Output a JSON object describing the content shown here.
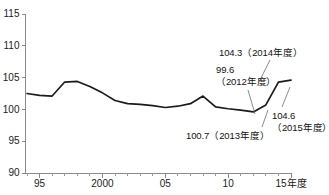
{
  "chart_data": {
    "type": "line",
    "title": "",
    "subtitle": "",
    "xlabel": "年度",
    "ylabel": "",
    "xlim": [
      1994,
      2015
    ],
    "ylim": [
      90,
      115
    ],
    "grid": false,
    "legend": "none",
    "y_ticks": [
      90,
      95,
      100,
      105,
      110,
      115
    ],
    "y_tick_labels": [
      "90",
      "95",
      "100",
      "105",
      "110",
      "115"
    ],
    "x_major_ticks": [
      1995,
      2000,
      2005,
      2010,
      2015
    ],
    "x_major_labels": [
      "95",
      "2000",
      "05",
      "10",
      "15年度"
    ],
    "x_minor_step": 1,
    "series": [
      {
        "name": "指数",
        "color": "#1b1b1b",
        "x": [
          1994,
          1995,
          1996,
          1997,
          1998,
          1999,
          2000,
          2001,
          2002,
          2003,
          2004,
          2005,
          2006,
          2007,
          2008,
          2009,
          2010,
          2011,
          2012,
          2013,
          2014,
          2015
        ],
        "values": [
          102.5,
          102.2,
          102.1,
          104.3,
          104.4,
          103.6,
          102.6,
          101.4,
          100.9,
          100.8,
          100.6,
          100.3,
          100.5,
          100.9,
          102.1,
          100.4,
          100.1,
          99.9,
          99.6,
          100.7,
          104.3,
          104.6
        ]
      }
    ],
    "annotations": [
      {
        "id": "annot-2014",
        "text": "104.3（2014年度）",
        "value": 104.3,
        "year": 2014,
        "label_x": 219,
        "label_y": 47,
        "leader": {
          "x1": 270,
          "y1": 60,
          "x2": 259,
          "y2": 82
        }
      },
      {
        "id": "annot-2012",
        "text": "99.6\n（2012年度）",
        "value": 99.6,
        "year": 2012,
        "label_x": 216,
        "label_y": 64,
        "leader": {
          "x1": 248,
          "y1": 90,
          "x2": 255,
          "y2": 114
        }
      },
      {
        "id": "annot-2013",
        "text": "100.7（2013年度）",
        "value": 100.7,
        "year": 2013,
        "label_x": 186,
        "label_y": 130,
        "leader": {
          "x1": 262,
          "y1": 127,
          "x2": 268,
          "y2": 110
        }
      },
      {
        "id": "annot-2015",
        "text": "104.6\n（2015年度）",
        "value": 104.6,
        "year": 2015,
        "label_x": 272,
        "label_y": 110,
        "leader": {
          "x1": 282,
          "y1": 107,
          "x2": 290,
          "y2": 87
        }
      }
    ]
  }
}
